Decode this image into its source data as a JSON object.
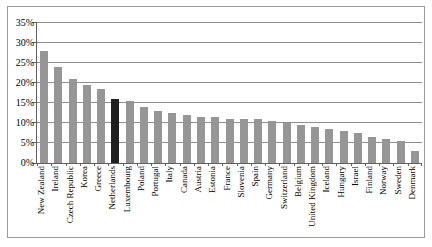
{
  "chart_data": {
    "type": "bar",
    "title": "",
    "xlabel": "",
    "ylabel": "",
    "unit": "%",
    "grid": true,
    "legend": "none",
    "ylim": [
      0,
      35
    ],
    "ytick_values": [
      0,
      5,
      10,
      15,
      20,
      25,
      30,
      35
    ],
    "ytick_labels": [
      "0%",
      "5%",
      "10%",
      "15%",
      "20%",
      "25%",
      "30%",
      "35%"
    ],
    "categories": [
      "New Zealand",
      "Ireland",
      "Czech Republic",
      "Korea",
      "Greece",
      "Netherlands",
      "Luxembourg",
      "Poland",
      "Portugal",
      "Italy",
      "Canada",
      "Austria",
      "Estonia",
      "France",
      "Slovenia",
      "Spain",
      "Germany",
      "Switzerland",
      "Belgium",
      "United Kingdom",
      "Iceland",
      "Hungary",
      "Israel",
      "Finland",
      "Norway",
      "Sweden",
      "Denmark"
    ],
    "values": [
      28,
      24,
      21,
      19.5,
      18.5,
      16,
      15.5,
      14,
      13,
      12.5,
      12,
      11.5,
      11.5,
      11,
      11,
      11,
      10.5,
      10,
      9.5,
      9,
      8.5,
      8,
      7.5,
      6.5,
      6,
      5.5,
      3
    ],
    "highlight_category": "Netherlands",
    "colors": {
      "bar": "#969696",
      "highlight_bar": "#1f1f1f",
      "gridline": "#8f8f8f",
      "axis": "#5f5f5f",
      "frame_border": "#9b9b9b",
      "background": "#ffffff",
      "text": "#000000"
    }
  }
}
